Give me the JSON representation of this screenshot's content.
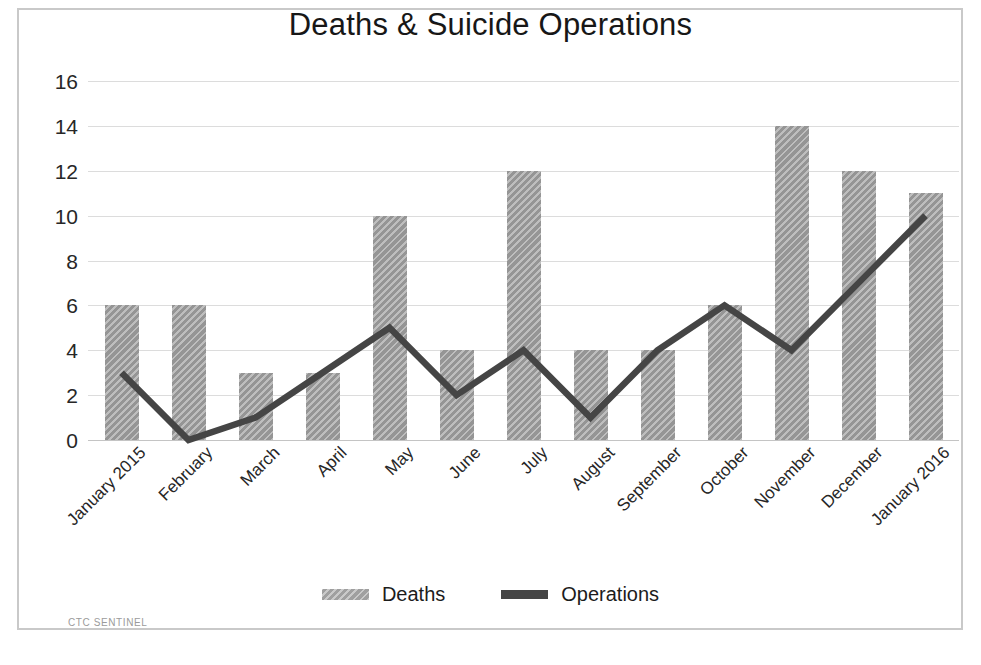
{
  "chart_data": {
    "type": "bar",
    "title": "Deaths & Suicide Operations",
    "xlabel": "",
    "ylabel": "",
    "ylim": [
      0,
      16
    ],
    "ytick_step": 2,
    "yticks": [
      16,
      14,
      12,
      10,
      8,
      6,
      4,
      2,
      0
    ],
    "grid": true,
    "legend_position": "bottom",
    "categories": [
      "January 2015",
      "February",
      "March",
      "April",
      "May",
      "June",
      "July",
      "August",
      "September",
      "October",
      "November",
      "December",
      "January 2016"
    ],
    "series": [
      {
        "name": "Deaths",
        "type": "bar",
        "color": "#9d9d9d",
        "values": [
          6,
          6,
          3,
          3,
          10,
          4,
          12,
          4,
          4,
          6,
          14,
          12,
          11
        ]
      },
      {
        "name": "Operations",
        "type": "line",
        "color": "#454545",
        "values": [
          3,
          0,
          1,
          3,
          5,
          2,
          4,
          1,
          4,
          6,
          4,
          7,
          10
        ]
      }
    ]
  },
  "legend": {
    "items": [
      {
        "label": "Deaths",
        "marker": "bar-swatch"
      },
      {
        "label": "Operations",
        "marker": "line-swatch"
      }
    ]
  },
  "watermark": {
    "text": "CTC SENTINEL"
  },
  "colors": {
    "bar_fill": "#9d9d9d",
    "line_stroke": "#454545",
    "gridline": "#dcdcdc",
    "frame": "#c9c9c9",
    "background": "#ffffff",
    "text": "#1a1a1a"
  }
}
